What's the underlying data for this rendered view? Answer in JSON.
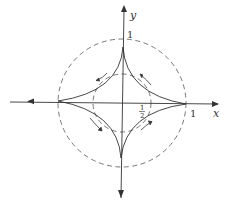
{
  "diagram": {
    "type": "astroid with circles",
    "axes": {
      "x_label": "x",
      "y_label": "y"
    },
    "labels": {
      "y_tick_one": "1",
      "x_tick_one": "1",
      "half_num": "1",
      "half_den": "2"
    },
    "elements": {
      "outer_circle": {
        "radius": 1,
        "style": "dashed"
      },
      "inner_circle": {
        "radius": 0.5,
        "style": "dashed"
      },
      "astroid": {
        "style": "solid",
        "cusps": 4
      },
      "flow_arrows": 4
    },
    "colors": {
      "stroke": "#333333",
      "background": "#ffffff"
    }
  }
}
